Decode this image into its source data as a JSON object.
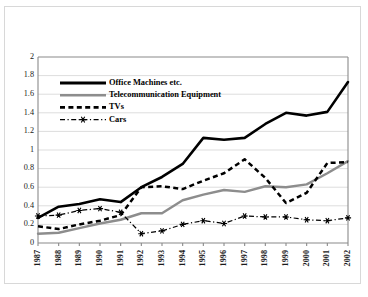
{
  "chart_data": {
    "type": "line",
    "title": "",
    "xlabel": "",
    "ylabel": "",
    "ylim": [
      0,
      2
    ],
    "ytick_step": 0.2,
    "grid": true,
    "legend_position": "inside-upper-left",
    "categories": [
      "1987",
      "1988",
      "1989",
      "1990",
      "1991",
      "1992",
      "1993",
      "1994",
      "1995",
      "1996",
      "1997",
      "1998",
      "1999",
      "2000",
      "2001",
      "2002"
    ],
    "yticks": [
      "0",
      "0.2",
      "0.4",
      "0.6",
      "0.8",
      "1",
      "1.2",
      "1.4",
      "1.6",
      "1.8",
      "2"
    ],
    "series": [
      {
        "name": "Office Machines etc.",
        "style": "solid-thick-black",
        "color": "#000000",
        "values": [
          0.27,
          0.39,
          0.42,
          0.47,
          0.44,
          0.6,
          0.71,
          0.85,
          1.13,
          1.11,
          1.13,
          1.28,
          1.4,
          1.37,
          1.41,
          1.73
        ]
      },
      {
        "name": "Telecommunication Equipment",
        "style": "solid-gray",
        "color": "#8d8d8d",
        "values": [
          0.1,
          0.11,
          0.16,
          0.21,
          0.25,
          0.32,
          0.32,
          0.46,
          0.52,
          0.57,
          0.55,
          0.61,
          0.6,
          0.63,
          0.75,
          0.88
        ]
      },
      {
        "name": "TVs",
        "style": "dashed-black",
        "color": "#000000",
        "values": [
          0.18,
          0.15,
          0.2,
          0.24,
          0.3,
          0.6,
          0.61,
          0.58,
          0.67,
          0.75,
          0.9,
          0.7,
          0.43,
          0.54,
          0.86,
          0.87
        ]
      },
      {
        "name": "Cars",
        "style": "dash-dot-star-marker",
        "color": "#000000",
        "marker": "star",
        "values": [
          0.29,
          0.3,
          0.35,
          0.37,
          0.33,
          0.1,
          0.13,
          0.2,
          0.24,
          0.21,
          0.29,
          0.28,
          0.28,
          0.25,
          0.24,
          0.27
        ]
      }
    ]
  },
  "legend": {
    "items": [
      {
        "label": "Office Machines etc."
      },
      {
        "label": "Telecommunication Equipment"
      },
      {
        "label": "TVs"
      },
      {
        "label": "Cars"
      }
    ]
  }
}
